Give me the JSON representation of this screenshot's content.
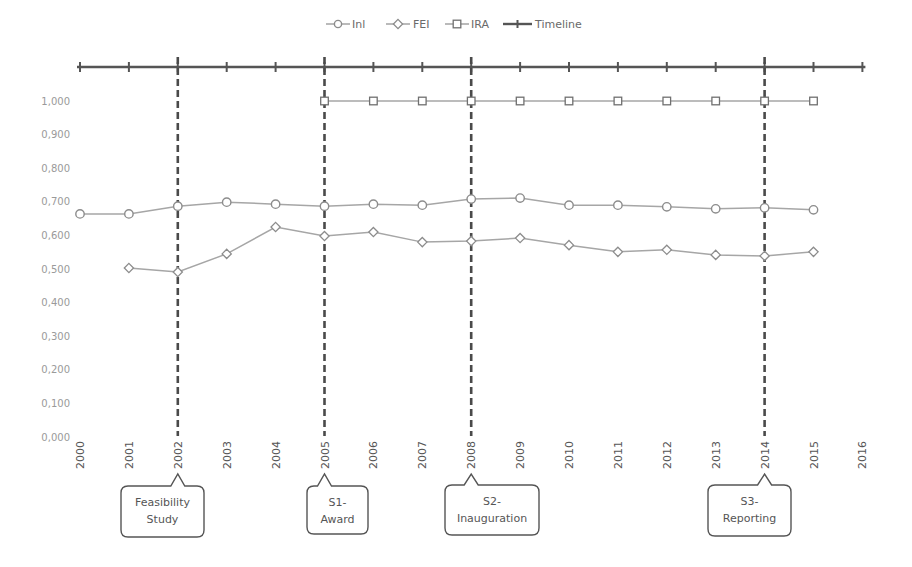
{
  "chart_data": {
    "type": "line",
    "title": "",
    "xlabel": "",
    "ylabel": "",
    "x": [
      2000,
      2001,
      2002,
      2003,
      2004,
      2005,
      2006,
      2007,
      2008,
      2009,
      2010,
      2011,
      2012,
      2013,
      2014,
      2015,
      2016
    ],
    "x_tick_labels": [
      "2000",
      "2001",
      "2002",
      "2003",
      "2004",
      "2005",
      "2006",
      "2007",
      "2008",
      "2009",
      "2010",
      "2011",
      "2012",
      "2013",
      "2014",
      "2015",
      "2016"
    ],
    "ylim": [
      0,
      1
    ],
    "y_ticks": [
      0,
      0.1,
      0.2,
      0.3,
      0.4,
      0.5,
      0.6,
      0.7,
      0.8,
      0.9,
      1.0
    ],
    "y_tick_labels": [
      "0,000",
      "0,100",
      "0,200",
      "0,300",
      "0,400",
      "0,500",
      "0,600",
      "0,700",
      "0,800",
      "0,900",
      "1,000"
    ],
    "grid": false,
    "legend_position": "top",
    "series": [
      {
        "name": "Inl",
        "marker": "circle",
        "color": "#9a9a9a",
        "x": [
          2000,
          2001,
          2002,
          2003,
          2004,
          2005,
          2006,
          2007,
          2008,
          2009,
          2010,
          2011,
          2012,
          2013,
          2014,
          2015
        ],
        "values": [
          0.664,
          0.664,
          0.687,
          0.699,
          0.693,
          0.687,
          0.693,
          0.69,
          0.708,
          0.711,
          0.69,
          0.69,
          0.685,
          0.679,
          0.682,
          0.676
        ]
      },
      {
        "name": "FEI",
        "marker": "diamond",
        "color": "#a0a0a0",
        "x": [
          2001,
          2002,
          2003,
          2004,
          2005,
          2006,
          2007,
          2008,
          2009,
          2010,
          2011,
          2012,
          2013,
          2014,
          2015
        ],
        "values": [
          0.503,
          0.491,
          0.545,
          0.625,
          0.598,
          0.61,
          0.58,
          0.583,
          0.592,
          0.571,
          0.551,
          0.557,
          0.542,
          0.539,
          0.551
        ]
      },
      {
        "name": "IRA",
        "marker": "square",
        "color": "#8a8a8a",
        "x": [
          2005,
          2006,
          2007,
          2008,
          2009,
          2010,
          2011,
          2012,
          2013,
          2014,
          2015
        ],
        "values": [
          1.0,
          1.0,
          1.0,
          1.0,
          1.0,
          1.0,
          1.0,
          1.0,
          1.0,
          1.0,
          1.0
        ]
      },
      {
        "name": "Timeline",
        "marker": "tick",
        "color": "#555555",
        "x": [
          2000,
          2016
        ],
        "note": "horizontal timeline drawn above the plot with tick marks at each year"
      }
    ],
    "milestones": [
      {
        "year": 2002,
        "label_line1": "Feasibility",
        "label_line2": "Study"
      },
      {
        "year": 2005,
        "label_line1": "S1-",
        "label_line2": "Award"
      },
      {
        "year": 2008,
        "label_line1": "S2-",
        "label_line2": "Inauguration"
      },
      {
        "year": 2014,
        "label_line1": "S3-",
        "label_line2": "Reporting"
      }
    ]
  },
  "legend": {
    "items": [
      {
        "label": "Inl",
        "marker": "circle"
      },
      {
        "label": "FEI",
        "marker": "diamond"
      },
      {
        "label": "IRA",
        "marker": "square"
      },
      {
        "label": "Timeline",
        "marker": "tick"
      }
    ]
  },
  "colors": {
    "series_line": "#a6a6a6",
    "marker_stroke": "#8c8c8c",
    "timeline": "#555555",
    "milestone_dash": "#4a4a4a",
    "callout_border": "#555555",
    "axis_text": "#9a9a9a",
    "year_text": "#555555"
  }
}
